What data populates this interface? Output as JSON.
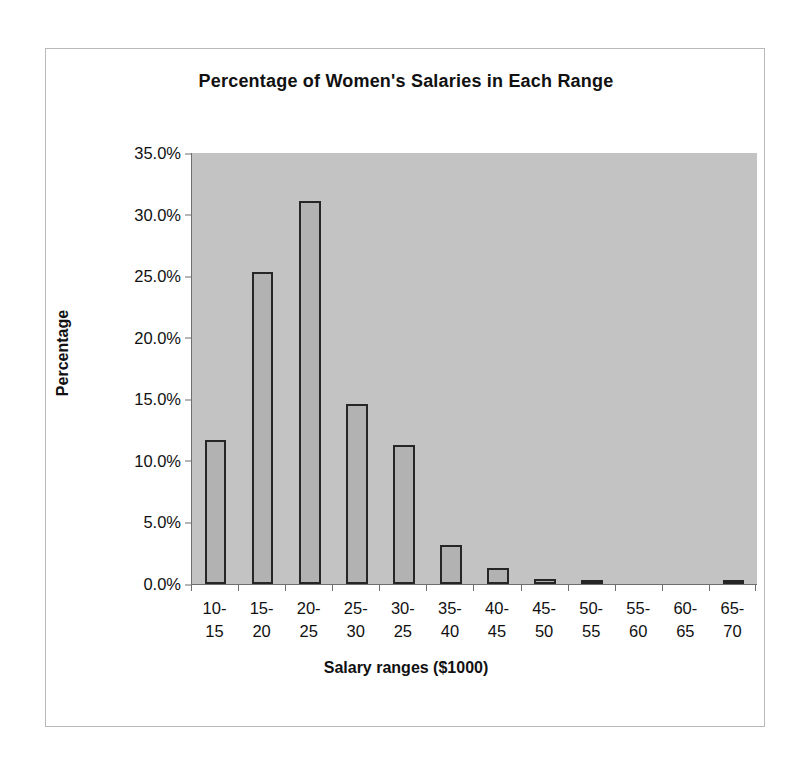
{
  "chart_data": {
    "type": "bar",
    "title": "Percentage of Women's Salaries in Each Range",
    "xlabel": "Salary ranges ($1000)",
    "ylabel": "Percentage",
    "categories": [
      "10-15",
      "15-20",
      "20-25",
      "25-30",
      "30-25",
      "35-40",
      "40-45",
      "45-50",
      "50-55",
      "55-60",
      "60-65",
      "65-70"
    ],
    "category_lines": [
      [
        "10-",
        "15"
      ],
      [
        "15-",
        "20"
      ],
      [
        "20-",
        "25"
      ],
      [
        "25-",
        "30"
      ],
      [
        "30-",
        "25"
      ],
      [
        "35-",
        "40"
      ],
      [
        "40-",
        "45"
      ],
      [
        "45-",
        "50"
      ],
      [
        "50-",
        "55"
      ],
      [
        "55-",
        "60"
      ],
      [
        "60-",
        "65"
      ],
      [
        "65-",
        "70"
      ]
    ],
    "values": [
      11.7,
      25.3,
      31.1,
      14.6,
      11.3,
      3.2,
      1.3,
      0.4,
      0.2,
      0.0,
      0.0,
      0.15
    ],
    "ylim": [
      0,
      35
    ],
    "ytick_labels": [
      "0.0%",
      "5.0%",
      "10.0%",
      "15.0%",
      "20.0%",
      "25.0%",
      "30.0%",
      "35.0%"
    ],
    "ytick_values": [
      0,
      5,
      10,
      15,
      20,
      25,
      30,
      35
    ],
    "grid": false,
    "legend": "none",
    "colors": {
      "bar_fill": "#b2b2b2",
      "bar_edge": "#262626",
      "plot_background": "#c3c3c3",
      "figure_background": "#ffffff",
      "axis": "#6e6e6e",
      "text": "#111111"
    }
  }
}
